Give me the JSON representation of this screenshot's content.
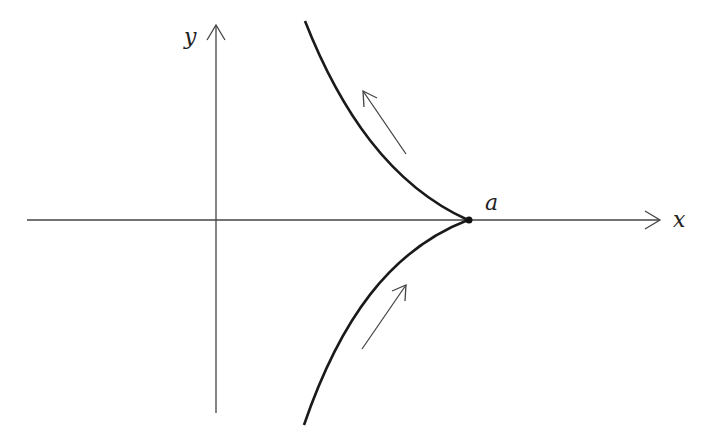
{
  "diagram": {
    "type": "cusp-curve-phase-diagram",
    "axes": {
      "x_label": "x",
      "y_label": "y"
    },
    "point_label": "a",
    "colors": {
      "axis": "#444444",
      "curve": "#1a1a1a",
      "arrow": "#444444",
      "background": "#ffffff"
    },
    "elements": [
      {
        "kind": "curve",
        "name": "upper-branch",
        "description": "curve from upper-left descending to cusp at a"
      },
      {
        "kind": "curve",
        "name": "lower-branch",
        "description": "curve from lower-left ascending to cusp at a"
      },
      {
        "kind": "arrow",
        "name": "upper-direction-arrow",
        "direction": "up-left"
      },
      {
        "kind": "arrow",
        "name": "lower-direction-arrow",
        "direction": "up-right"
      },
      {
        "kind": "point",
        "name": "cusp-point",
        "label": "a"
      }
    ]
  }
}
